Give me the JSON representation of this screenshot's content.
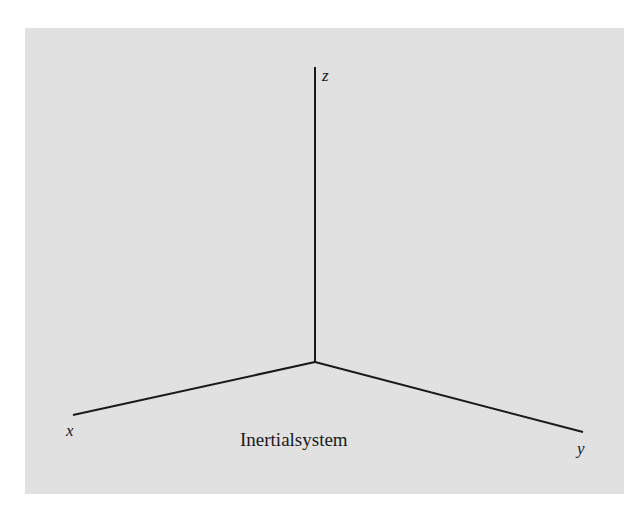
{
  "diagram": {
    "type": "3d-coordinate-axes",
    "origin": [
      315,
      362
    ],
    "axes": [
      {
        "name": "x",
        "label": "x",
        "end": [
          73,
          415
        ]
      },
      {
        "name": "y",
        "label": "y",
        "end": [
          583,
          432
        ]
      },
      {
        "name": "z",
        "label": "z",
        "end": [
          315,
          67
        ]
      }
    ],
    "caption": "Inertialsystem",
    "colors": {
      "background": "#e1e1e1",
      "line": "#1a1a1a"
    }
  }
}
